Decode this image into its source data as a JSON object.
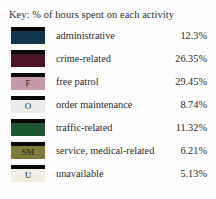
{
  "legend": {
    "title": "Key: % of hours spent on each activity",
    "background": "#fdfdfd",
    "top_bar_color": "#080808",
    "rows": [
      {
        "label": "administrative",
        "value": "12.3%",
        "percent": 12.3,
        "swatch_letter": "",
        "color": "#12354f"
      },
      {
        "label": "crime-related",
        "value": "26.35%",
        "percent": 26.35,
        "swatch_letter": "",
        "color": "#4a1426"
      },
      {
        "label": "free patrol",
        "value": "29.45%",
        "percent": 29.45,
        "swatch_letter": "F",
        "color": "#c59aab"
      },
      {
        "label": "order maintenance",
        "value": "8.74%",
        "percent": 8.74,
        "swatch_letter": "O",
        "color": "#ebebeb"
      },
      {
        "label": "traffic-related",
        "value": "11.32%",
        "percent": 11.32,
        "swatch_letter": "",
        "color": "#1d5631"
      },
      {
        "label": "service, medical-related",
        "value": "6.21%",
        "percent": 6.21,
        "swatch_letter": "SM",
        "color": "#7d7b3c"
      },
      {
        "label": "unavailable",
        "value": "5.13%",
        "percent": 5.13,
        "swatch_letter": "U",
        "color": "#f2efe2"
      }
    ]
  },
  "chart_data": {
    "type": "table",
    "title": "Key: % of hours spent on each activity",
    "xlabel": "",
    "ylabel": "",
    "categories": [
      "administrative",
      "crime-related",
      "free patrol",
      "order maintenance",
      "traffic-related",
      "service, medical-related",
      "unavailable"
    ],
    "values": [
      12.3,
      26.35,
      29.45,
      8.74,
      11.32,
      6.21,
      5.13
    ],
    "value_labels": [
      "12.3%",
      "26.35%",
      "29.45%",
      "8.74%",
      "11.32%",
      "6.21%",
      "5.13%"
    ],
    "colors": [
      "#12354f",
      "#4a1426",
      "#c59aab",
      "#ebebeb",
      "#1d5631",
      "#7d7b3c",
      "#f2efe2"
    ],
    "swatch_letters": [
      "",
      "",
      "F",
      "O",
      "",
      "SM",
      "U"
    ],
    "legend_position": "left",
    "grid": false
  }
}
